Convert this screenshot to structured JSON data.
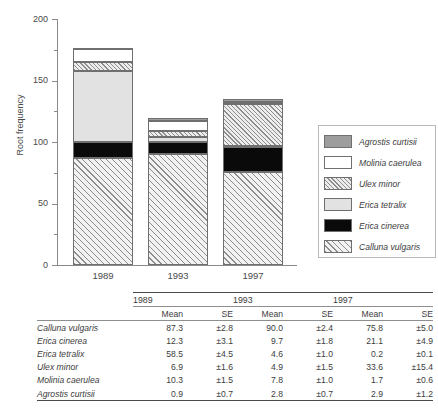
{
  "chart_data": {
    "type": "bar",
    "stacked": true,
    "title": "",
    "xlabel": "",
    "ylabel": "Root frequency",
    "categories": [
      "1989",
      "1993",
      "1997"
    ],
    "ylim": [
      0,
      200
    ],
    "yticks": [
      0,
      50,
      100,
      150,
      200
    ],
    "yticks_minor": [
      25,
      75,
      125,
      175
    ],
    "grid": false,
    "legend_position": "right",
    "stack_order_bottom_to_top": [
      "Calluna vulgaris",
      "Erica cinerea",
      "Erica tetralix",
      "Ulex minor",
      "Molinia caerulea",
      "Agrostis curtisii"
    ],
    "series": [
      {
        "name": "Calluna vulgaris",
        "values": [
          87.3,
          90.0,
          75.8
        ],
        "errors": [
          2.8,
          2.4,
          5.0
        ],
        "pattern": "diagonal-hatch-wide",
        "color": "#f2f2f2"
      },
      {
        "name": "Erica cinerea",
        "values": [
          12.3,
          9.7,
          21.1
        ],
        "errors": [
          3.1,
          1.8,
          4.9
        ],
        "pattern": "solid",
        "color": "#0a0a0a"
      },
      {
        "name": "Erica tetralix",
        "values": [
          58.5,
          4.6,
          0.2
        ],
        "errors": [
          4.5,
          1.0,
          0.1
        ],
        "pattern": "solid",
        "color": "#e2e2e2"
      },
      {
        "name": "Ulex minor",
        "values": [
          6.9,
          4.9,
          33.6
        ],
        "errors": [
          1.6,
          1.5,
          15.4
        ],
        "pattern": "diagonal-hatch-dense",
        "color": "#ededed"
      },
      {
        "name": "Molinia caerulea",
        "values": [
          10.3,
          7.8,
          1.7
        ],
        "errors": [
          1.5,
          1.0,
          0.6
        ],
        "pattern": "solid",
        "color": "#ffffff"
      },
      {
        "name": "Agrostis curtisii",
        "values": [
          0.9,
          2.8,
          2.9
        ],
        "errors": [
          0.7,
          0.7,
          1.2
        ],
        "pattern": "solid",
        "color": "#9d9d9d"
      }
    ],
    "totals": [
      176.2,
      119.8,
      135.3
    ]
  },
  "axis": {
    "y_title": "Root frequency",
    "y_tick_labels": [
      "0",
      "50",
      "100",
      "150",
      "200"
    ],
    "x_tick_labels": [
      "1989",
      "1993",
      "1997"
    ]
  },
  "legend": {
    "items": [
      {
        "label": "Agrostis curtisii",
        "swatch": "swatch-agrostis-curtisii"
      },
      {
        "label": "Molinia caerulea",
        "swatch": "swatch-molinia-caerulea"
      },
      {
        "label": "Ulex minor",
        "swatch": "swatch-ulex-minor"
      },
      {
        "label": "Erica tetralix",
        "swatch": "swatch-erica-tetralix"
      },
      {
        "label": "Erica cinerea",
        "swatch": "swatch-erica-cinerea"
      },
      {
        "label": "Calluna vulgaris",
        "swatch": "swatch-calluna-vulgaris"
      }
    ]
  },
  "table": {
    "year_headers": [
      "1989",
      "1993",
      "1997"
    ],
    "sub_headers": [
      "Mean",
      "SE",
      "Mean",
      "SE",
      "Mean",
      "SE"
    ],
    "rows": [
      {
        "name": "Calluna vulgaris",
        "cells": [
          "87.3",
          "±2.8",
          "90.0",
          "±2.4",
          "75.8",
          "±5.0"
        ]
      },
      {
        "name": "Erica cinerea",
        "cells": [
          "12.3",
          "±3.1",
          "9.7",
          "±1.8",
          "21.1",
          "±4.9"
        ]
      },
      {
        "name": "Erica tetralix",
        "cells": [
          "58.5",
          "±4.5",
          "4.6",
          "±1.0",
          "0.2",
          "±0.1"
        ]
      },
      {
        "name": "Ulex minor",
        "cells": [
          "6.9",
          "±1.6",
          "4.9",
          "±1.5",
          "33.6",
          "±15.4"
        ]
      },
      {
        "name": "Molinia caerulea",
        "cells": [
          "10.3",
          "±1.5",
          "7.8",
          "±1.0",
          "1.7",
          "±0.6"
        ]
      },
      {
        "name": "Agrostis curtisii",
        "cells": [
          "0.9",
          "±0.7",
          "2.8",
          "±0.7",
          "2.9",
          "±1.2"
        ]
      }
    ]
  }
}
